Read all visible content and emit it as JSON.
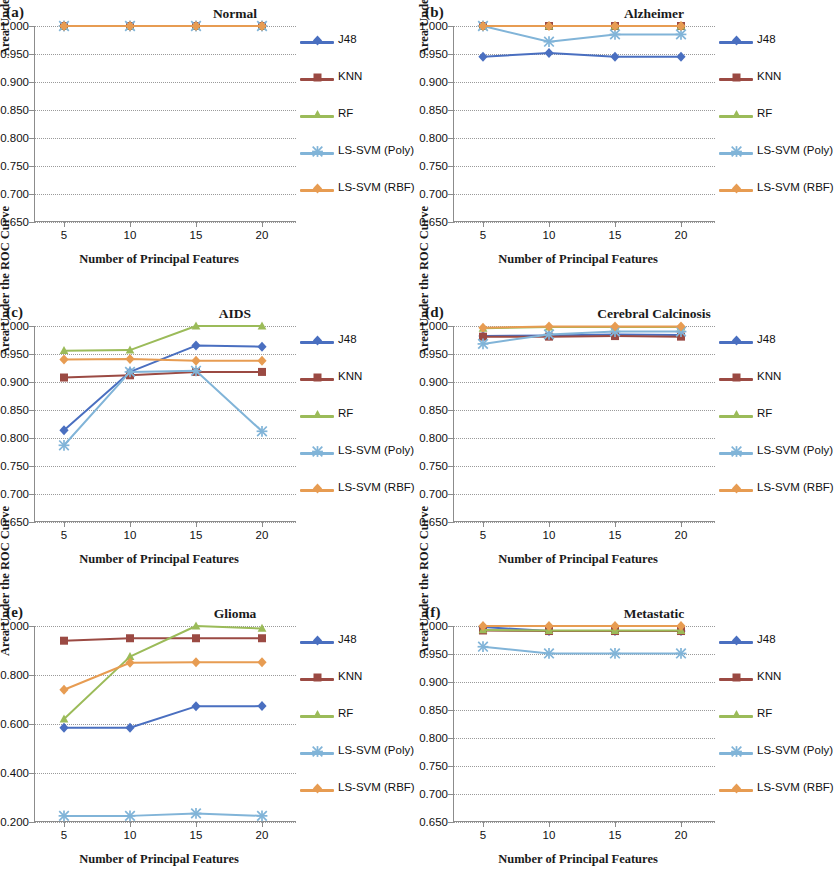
{
  "figure": {
    "axis_titles": {
      "y": "Area Under the ROC Curve",
      "x": "Number of Principal Features"
    },
    "series_names": [
      "J48",
      "KNN",
      "RF",
      "LS-SVM (Poly)",
      "LS-SVM (RBF)"
    ],
    "colors": {
      "J48": "#4A6FC0",
      "KNN": "#9B4A43",
      "RF": "#9BBB59",
      "LS-SVM (Poly)": "#81B4D8",
      "LS-SVM (RBF)": "#E79C52"
    },
    "markers": {
      "J48": "diamond",
      "KNN": "square",
      "RF": "triangle",
      "LS-SVM (Poly)": "cross",
      "LS-SVM (RBF)": "diamond"
    },
    "panel_labels": [
      "(a)",
      "(b)",
      "(c)",
      "(d)",
      "(e)",
      "(f)"
    ]
  },
  "chart_data": [
    {
      "type": "line",
      "panel": "(a)",
      "title": "Normal",
      "xlabel": "Number of Principal Features",
      "ylabel": "Area Under the ROC Curve",
      "x": [
        5,
        10,
        15,
        20
      ],
      "xticklabels": [
        "5",
        "10",
        "15",
        "20"
      ],
      "yticklabels": [
        "0.650",
        "0.700",
        "0.750",
        "0.800",
        "0.850",
        "0.900",
        "0.950",
        "1.000"
      ],
      "ylim": [
        0.65,
        1.0
      ],
      "ytick_step": 0.05,
      "grid": true,
      "legend_position": "right",
      "series": [
        {
          "name": "J48",
          "values": [
            1.0,
            1.0,
            1.0,
            1.0
          ]
        },
        {
          "name": "KNN",
          "values": [
            1.0,
            1.0,
            1.0,
            1.0
          ]
        },
        {
          "name": "RF",
          "values": [
            1.0,
            1.0,
            1.0,
            1.0
          ]
        },
        {
          "name": "LS-SVM (Poly)",
          "values": [
            1.0,
            1.0,
            1.0,
            1.0
          ]
        },
        {
          "name": "LS-SVM (RBF)",
          "values": [
            1.0,
            1.0,
            1.0,
            1.0
          ]
        }
      ]
    },
    {
      "type": "line",
      "panel": "(b)",
      "title": "Alzheimer",
      "xlabel": "Number of Principal Features",
      "ylabel": "Area Under the ROC Curve",
      "x": [
        5,
        10,
        15,
        20
      ],
      "xticklabels": [
        "5",
        "10",
        "15",
        "20"
      ],
      "yticklabels": [
        "0.650",
        "0.700",
        "0.750",
        "0.800",
        "0.850",
        "0.900",
        "0.950",
        "1.000"
      ],
      "ylim": [
        0.65,
        1.0
      ],
      "ytick_step": 0.05,
      "grid": true,
      "legend_position": "right",
      "series": [
        {
          "name": "J48",
          "values": [
            0.945,
            0.952,
            0.945,
            0.945
          ]
        },
        {
          "name": "KNN",
          "values": [
            1.0,
            1.0,
            1.0,
            1.0
          ]
        },
        {
          "name": "RF",
          "values": [
            1.0,
            1.0,
            1.0,
            1.0
          ]
        },
        {
          "name": "LS-SVM (Poly)",
          "values": [
            1.0,
            0.972,
            0.985,
            0.985
          ]
        },
        {
          "name": "LS-SVM (RBF)",
          "values": [
            1.0,
            1.0,
            1.0,
            1.0
          ]
        }
      ]
    },
    {
      "type": "line",
      "panel": "(c)",
      "title": "AIDS",
      "xlabel": "Number of Principal Features",
      "ylabel": "Area Under the ROC Curve",
      "x": [
        5,
        10,
        15,
        20
      ],
      "xticklabels": [
        "5",
        "10",
        "15",
        "20"
      ],
      "yticklabels": [
        "0.650",
        "0.700",
        "0.750",
        "0.800",
        "0.850",
        "0.900",
        "0.950",
        "1.000"
      ],
      "ylim": [
        0.65,
        1.0
      ],
      "ytick_step": 0.05,
      "grid": true,
      "legend_position": "right",
      "series": [
        {
          "name": "J48",
          "values": [
            0.814,
            0.918,
            0.965,
            0.963
          ]
        },
        {
          "name": "KNN",
          "values": [
            0.908,
            0.912,
            0.918,
            0.918
          ]
        },
        {
          "name": "RF",
          "values": [
            0.956,
            0.957,
            1.0,
            1.0
          ]
        },
        {
          "name": "LS-SVM (Poly)",
          "values": [
            0.787,
            0.918,
            0.92,
            0.812
          ]
        },
        {
          "name": "LS-SVM (RBF)",
          "values": [
            0.94,
            0.941,
            0.938,
            0.938
          ]
        }
      ]
    },
    {
      "type": "line",
      "panel": "(d)",
      "title": "Cerebral Calcinosis",
      "xlabel": "Number of Principal Features",
      "ylabel": "Area Under the ROC Curve",
      "x": [
        5,
        10,
        15,
        20
      ],
      "xticklabels": [
        "5",
        "10",
        "15",
        "20"
      ],
      "yticklabels": [
        "0.650",
        "0.700",
        "0.750",
        "0.800",
        "0.850",
        "0.900",
        "0.950",
        "1.000"
      ],
      "ylim": [
        0.65,
        1.0
      ],
      "ytick_step": 0.05,
      "grid": true,
      "legend_position": "right",
      "series": [
        {
          "name": "J48",
          "values": [
            0.982,
            0.983,
            0.985,
            0.984
          ]
        },
        {
          "name": "KNN",
          "values": [
            0.981,
            0.981,
            0.982,
            0.981
          ]
        },
        {
          "name": "RF",
          "values": [
            0.996,
            0.998,
            0.998,
            0.998
          ]
        },
        {
          "name": "LS-SVM (Poly)",
          "values": [
            0.968,
            0.985,
            0.99,
            0.99
          ]
        },
        {
          "name": "LS-SVM (RBF)",
          "values": [
            0.997,
            0.999,
            0.999,
            0.999
          ]
        }
      ]
    },
    {
      "type": "line",
      "panel": "(e)",
      "title": "Glioma",
      "xlabel": "Number of Principal Features",
      "ylabel": "Area Under the ROC Curve",
      "x": [
        5,
        10,
        15,
        20
      ],
      "xticklabels": [
        "5",
        "10",
        "15",
        "20"
      ],
      "yticklabels": [
        "0.200",
        "0.400",
        "0.600",
        "0.800",
        "1.000"
      ],
      "ylim": [
        0.2,
        1.0
      ],
      "ytick_step": 0.2,
      "grid": true,
      "legend_position": "right",
      "series": [
        {
          "name": "J48",
          "values": [
            0.585,
            0.585,
            0.672,
            0.673
          ]
        },
        {
          "name": "KNN",
          "values": [
            0.94,
            0.95,
            0.95,
            0.95
          ]
        },
        {
          "name": "RF",
          "values": [
            0.62,
            0.875,
            1.0,
            0.99
          ]
        },
        {
          "name": "LS-SVM (Poly)",
          "values": [
            0.225,
            0.225,
            0.235,
            0.225
          ]
        },
        {
          "name": "LS-SVM (RBF)",
          "values": [
            0.74,
            0.85,
            0.852,
            0.852
          ]
        }
      ]
    },
    {
      "type": "line",
      "panel": "(f)",
      "title": "Metastatic",
      "xlabel": "Number of Principal Features",
      "ylabel": "Area Under the ROC Curve",
      "x": [
        5,
        10,
        15,
        20
      ],
      "xticklabels": [
        "5",
        "10",
        "15",
        "20"
      ],
      "yticklabels": [
        "0.650",
        "0.700",
        "0.750",
        "0.800",
        "0.850",
        "0.900",
        "0.950",
        "1.000"
      ],
      "ylim": [
        0.65,
        1.0
      ],
      "ytick_step": 0.05,
      "grid": true,
      "legend_position": "right",
      "series": [
        {
          "name": "J48",
          "values": [
            0.998,
            0.991,
            0.991,
            0.991
          ]
        },
        {
          "name": "KNN",
          "values": [
            0.992,
            0.991,
            0.991,
            0.991
          ]
        },
        {
          "name": "RF",
          "values": [
            0.993,
            0.992,
            0.992,
            0.992
          ]
        },
        {
          "name": "LS-SVM (Poly)",
          "values": [
            0.963,
            0.951,
            0.951,
            0.951
          ]
        },
        {
          "name": "LS-SVM (RBF)",
          "values": [
            1.0,
            1.0,
            1.0,
            1.0
          ]
        }
      ]
    }
  ]
}
